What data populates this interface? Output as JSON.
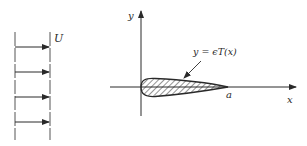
{
  "diagram": {
    "flow": {
      "label": "U",
      "arrow_count": 4
    },
    "axes": {
      "x_label": "x",
      "y_label": "y"
    },
    "airfoil": {
      "equation_label": "y = ϵT(x)",
      "chord_end_label": "a"
    },
    "colors": {
      "stroke": "#2a2a2a",
      "background": "#ffffff"
    }
  }
}
